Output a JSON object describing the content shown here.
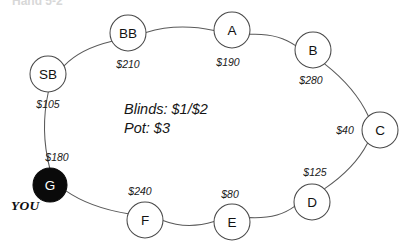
{
  "diagram": {
    "kind": "poker-table-seating-diagram",
    "top_clipped_text": "Hand 5-2",
    "center_info": {
      "blinds_line": "Blinds: $1/$2",
      "pot_line": "Pot: $3"
    },
    "hero_tag": "YOU",
    "colors": {
      "node_stroke": "#4a4a4a",
      "node_fill": "#ffffff",
      "hero_fill": "#0a0a0a",
      "hero_text": "#ffffff",
      "text": "#121212",
      "ring_stroke": "#5a5a5a",
      "background": "#ffffff"
    },
    "seats": [
      {
        "id": "sb",
        "label": "SB",
        "stack": "$105",
        "cx": 48,
        "cy": 74,
        "r": 18,
        "hero": false,
        "stack_x": 48,
        "stack_y": 104
      },
      {
        "id": "bb",
        "label": "BB",
        "stack": "$210",
        "cx": 128,
        "cy": 33,
        "r": 18,
        "hero": false,
        "stack_x": 128,
        "stack_y": 64
      },
      {
        "id": "a",
        "label": "A",
        "stack": "$190",
        "cx": 232,
        "cy": 30,
        "r": 18,
        "hero": false,
        "stack_x": 228,
        "stack_y": 62
      },
      {
        "id": "b",
        "label": "B",
        "stack": "$280",
        "cx": 313,
        "cy": 50,
        "r": 18,
        "hero": false,
        "stack_x": 311,
        "stack_y": 80
      },
      {
        "id": "c",
        "label": "C",
        "stack": "$40",
        "cx": 380,
        "cy": 130,
        "r": 18,
        "hero": false,
        "stack_x": 345,
        "stack_y": 130
      },
      {
        "id": "d",
        "label": "D",
        "stack": "$125",
        "cx": 312,
        "cy": 202,
        "r": 18,
        "hero": false,
        "stack_x": 315,
        "stack_y": 172
      },
      {
        "id": "e",
        "label": "E",
        "stack": "$80",
        "cx": 232,
        "cy": 222,
        "r": 18,
        "hero": false,
        "stack_x": 230,
        "stack_y": 194
      },
      {
        "id": "f",
        "label": "F",
        "stack": "$240",
        "cx": 145,
        "cy": 220,
        "r": 18,
        "hero": false,
        "stack_x": 140,
        "stack_y": 191
      },
      {
        "id": "g",
        "label": "G",
        "stack": "$180",
        "cx": 50,
        "cy": 185,
        "r": 17,
        "hero": true,
        "stack_x": 57,
        "stack_y": 157
      }
    ]
  }
}
